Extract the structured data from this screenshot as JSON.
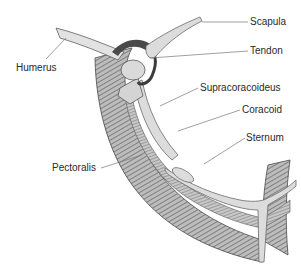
{
  "diagram": {
    "labels": [
      {
        "id": "scapula",
        "text": "Scapula"
      },
      {
        "id": "tendon",
        "text": "Tendon"
      },
      {
        "id": "humerus",
        "text": "Humerus"
      },
      {
        "id": "supracoracoideus",
        "text": "Supracoracoideus"
      },
      {
        "id": "coracoid",
        "text": "Coracoid"
      },
      {
        "id": "sternum",
        "text": "Sternum"
      },
      {
        "id": "pectoralis",
        "text": "Pectoralis"
      }
    ],
    "colors": {
      "bone": "#dcdcdc",
      "bone_outline": "#6a6a6a",
      "muscle_dark": "#5a5a5a",
      "muscle_light": "#b8b8b8",
      "leader_line": "#777777",
      "text": "#2a2a2a"
    }
  }
}
